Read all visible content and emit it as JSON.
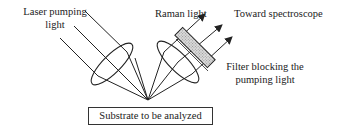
{
  "diagram": {
    "labels": {
      "laser_line1": "Laser pumping",
      "laser_line2": "light",
      "raman": "Raman light",
      "toward": "Toward spectroscope",
      "filter_line1": "Filter blocking the",
      "filter_line2": "pumping light",
      "substrate": "Substrate to be analyzed"
    },
    "colors": {
      "line": "#222222",
      "filter_fill": "#cccccc"
    }
  }
}
